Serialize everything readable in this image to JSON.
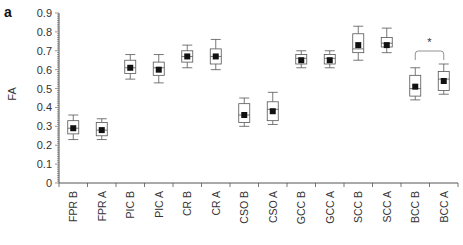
{
  "chart_data": {
    "type": "box",
    "panel_label": "a",
    "title": "",
    "xlabel": "",
    "ylabel": "FA",
    "ylim": [
      0,
      0.9
    ],
    "yticks": [
      "0",
      "0.1",
      "0.2",
      "0.3",
      "0.4",
      "0.5",
      "0.6",
      "0.7",
      "0.8",
      "0.9"
    ],
    "grid": false,
    "categories": [
      "FPR B",
      "FPR A",
      "PIC B",
      "PIC A",
      "CR B",
      "CR A",
      "CSO B",
      "CSO A",
      "GCC B",
      "GCC A",
      "SCC B",
      "SCC A",
      "BCC B",
      "BCC A"
    ],
    "boxes": [
      {
        "label": "FPR B",
        "whisker_high": 0.36,
        "q3": 0.33,
        "median": 0.29,
        "mean": 0.29,
        "q1": 0.26,
        "whisker_low": 0.23
      },
      {
        "label": "FPR A",
        "whisker_high": 0.34,
        "q3": 0.32,
        "median": 0.28,
        "mean": 0.28,
        "q1": 0.25,
        "whisker_low": 0.23
      },
      {
        "label": "PIC B",
        "whisker_high": 0.68,
        "q3": 0.65,
        "median": 0.61,
        "mean": 0.61,
        "q1": 0.58,
        "whisker_low": 0.55
      },
      {
        "label": "PIC A",
        "whisker_high": 0.68,
        "q3": 0.64,
        "median": 0.61,
        "mean": 0.6,
        "q1": 0.57,
        "whisker_low": 0.53
      },
      {
        "label": "CR B",
        "whisker_high": 0.73,
        "q3": 0.7,
        "median": 0.67,
        "mean": 0.67,
        "q1": 0.64,
        "whisker_low": 0.61
      },
      {
        "label": "CR A",
        "whisker_high": 0.76,
        "q3": 0.71,
        "median": 0.67,
        "mean": 0.67,
        "q1": 0.63,
        "whisker_low": 0.6
      },
      {
        "label": "CSO B",
        "whisker_high": 0.45,
        "q3": 0.42,
        "median": 0.36,
        "mean": 0.36,
        "q1": 0.32,
        "whisker_low": 0.3
      },
      {
        "label": "CSO A",
        "whisker_high": 0.48,
        "q3": 0.43,
        "median": 0.39,
        "mean": 0.38,
        "q1": 0.33,
        "whisker_low": 0.31
      },
      {
        "label": "GCC B",
        "whisker_high": 0.7,
        "q3": 0.68,
        "median": 0.66,
        "mean": 0.65,
        "q1": 0.63,
        "whisker_low": 0.61
      },
      {
        "label": "GCC A",
        "whisker_high": 0.7,
        "q3": 0.68,
        "median": 0.66,
        "mean": 0.65,
        "q1": 0.63,
        "whisker_low": 0.61
      },
      {
        "label": "SCC B",
        "whisker_high": 0.83,
        "q3": 0.79,
        "median": 0.71,
        "mean": 0.73,
        "q1": 0.69,
        "whisker_low": 0.65
      },
      {
        "label": "SCC A",
        "whisker_high": 0.82,
        "q3": 0.77,
        "median": 0.74,
        "mean": 0.73,
        "q1": 0.72,
        "whisker_low": 0.69
      },
      {
        "label": "BCC B",
        "whisker_high": 0.61,
        "q3": 0.57,
        "median": 0.5,
        "mean": 0.51,
        "q1": 0.46,
        "whisker_low": 0.44
      },
      {
        "label": "BCC A",
        "whisker_high": 0.63,
        "q3": 0.59,
        "median": 0.55,
        "mean": 0.54,
        "q1": 0.49,
        "whisker_low": 0.47
      }
    ],
    "annotations": [
      {
        "type": "significance_bracket",
        "from": "BCC B",
        "to": "BCC A",
        "text": "*"
      }
    ]
  },
  "colors": {
    "box_stroke": "#555555",
    "mean_marker": "#111111",
    "axis": "#555555",
    "text": "#333333"
  }
}
